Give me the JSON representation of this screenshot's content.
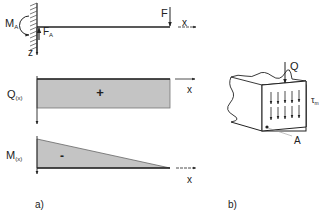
{
  "figure": {
    "part_a": {
      "caption": "a)",
      "beam": {
        "moment_label": "M",
        "moment_sub": "A",
        "reaction_label": "F",
        "reaction_sub": "A",
        "load_label": "F",
        "x_axis_label": "x",
        "z_axis_label": "z"
      },
      "shear_diagram": {
        "label": "Q",
        "label_sub": "(x)",
        "sign": "+",
        "x_axis_label": "x"
      },
      "moment_diagram": {
        "label": "M",
        "label_sub": "(x)",
        "sign": "-",
        "x_axis_label": "x"
      }
    },
    "part_b": {
      "caption": "b)",
      "shear_force_label": "Q",
      "stress_label": "τ",
      "stress_sub": "m",
      "point_label": "A"
    },
    "colors": {
      "line": "#222222",
      "fill": "#c4c4c4"
    }
  }
}
